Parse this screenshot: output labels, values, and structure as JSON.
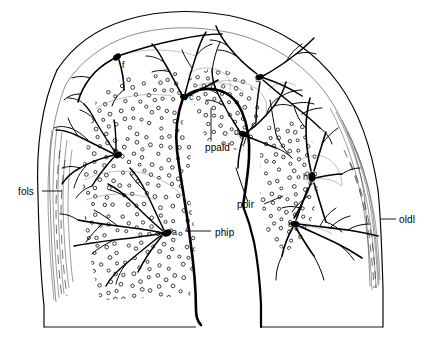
{
  "figure": {
    "type": "camera-lucida-neuroanatomical-section",
    "background_color": "#ffffff",
    "ink_color": "#000000",
    "stipple_color": "#000000"
  },
  "region_labels": [
    {
      "id": "fols",
      "text": "fols",
      "x": 18,
      "y": 187,
      "leader": {
        "x1": 42,
        "y1": 191,
        "x2": 62,
        "y2": 191
      }
    },
    {
      "id": "ppald",
      "text": "ppald",
      "x": 205,
      "y": 143,
      "leader": {
        "x1": 211,
        "y1": 108,
        "x2": 211,
        "y2": 139
      }
    },
    {
      "id": "ppir",
      "text": "ppir",
      "x": 237,
      "y": 200,
      "leader": {
        "x1": 264,
        "y1": 204,
        "x2": 283,
        "y2": 196
      }
    },
    {
      "id": "phip",
      "text": "phip",
      "x": 215,
      "y": 228,
      "leader": {
        "x1": 185,
        "y1": 231,
        "x2": 211,
        "y2": 231
      }
    },
    {
      "id": "oldl",
      "text": "oldl",
      "x": 399,
      "y": 215,
      "leader": {
        "x1": 381,
        "y1": 219,
        "x2": 396,
        "y2": 219
      }
    }
  ],
  "cell_labels": [
    {
      "id": "a",
      "text": "a",
      "x": 172,
      "y": 228
    },
    {
      "id": "b",
      "text": "b",
      "x": 113,
      "y": 148
    },
    {
      "id": "c",
      "text": "c",
      "x": 189,
      "y": 93
    },
    {
      "id": "d",
      "text": "d",
      "x": 234,
      "y": 128
    },
    {
      "id": "e",
      "text": "e",
      "x": 288,
      "y": 220
    },
    {
      "id": "f",
      "text": "f",
      "x": 122,
      "y": 61
    },
    {
      "id": "g",
      "text": "g",
      "x": 255,
      "y": 73
    },
    {
      "id": "h",
      "text": "h",
      "x": 303,
      "y": 173
    }
  ],
  "somata": [
    {
      "id": "a",
      "cx": 167,
      "cy": 233,
      "rx": 5.0,
      "ry": 3.4,
      "rot": -20
    },
    {
      "id": "b",
      "cx": 118,
      "cy": 155,
      "rx": 4.2,
      "ry": 3.0,
      "rot": -25
    },
    {
      "id": "c",
      "cx": 184,
      "cy": 97,
      "rx": 4.0,
      "ry": 2.8,
      "rot": 10
    },
    {
      "id": "d",
      "cx": 243,
      "cy": 134,
      "rx": 4.4,
      "ry": 3.0,
      "rot": 15
    },
    {
      "id": "e",
      "cx": 295,
      "cy": 224,
      "rx": 4.4,
      "ry": 3.0,
      "rot": 5
    },
    {
      "id": "f",
      "cx": 117,
      "cy": 57,
      "rx": 4.4,
      "ry": 3.0,
      "rot": -35
    },
    {
      "id": "g",
      "cx": 260,
      "cy": 77,
      "rx": 4.0,
      "ry": 2.8,
      "rot": -10
    },
    {
      "id": "h",
      "cx": 312,
      "cy": 177,
      "rx": 3.6,
      "ry": 5.0,
      "rot": 0
    }
  ],
  "stipple_fields": [
    {
      "id": "left-field",
      "label_ref": "phip",
      "count": 300
    },
    {
      "id": "upper-field",
      "label_ref": "ppald",
      "count": 120
    },
    {
      "id": "right-field",
      "label_ref": "ppir",
      "count": 175
    }
  ]
}
